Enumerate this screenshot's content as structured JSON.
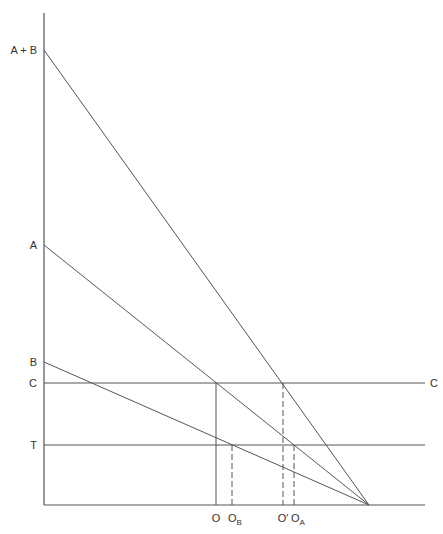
{
  "diagram": {
    "colors": {
      "line": "#555555",
      "text": "#333333",
      "background": "#ffffff"
    },
    "y_axis_labels": [
      {
        "id": "a_plus_b",
        "text": "A + B",
        "y": 50
      },
      {
        "id": "a",
        "text": "A",
        "y": 245
      },
      {
        "id": "b",
        "text": "B",
        "y": 362
      },
      {
        "id": "c",
        "text": "C",
        "y": 383
      },
      {
        "id": "t",
        "text": "T",
        "y": 445
      }
    ],
    "right_label": {
      "text": "C"
    },
    "x_axis_labels": [
      {
        "id": "o",
        "main": "O",
        "sub": "",
        "x": 216
      },
      {
        "id": "o_b",
        "main": "O",
        "sub": "B",
        "x": 232
      },
      {
        "id": "o_prime",
        "main": "O′",
        "sub": "",
        "x": 283
      },
      {
        "id": "o_a",
        "main": "O",
        "sub": "A",
        "x": 294
      }
    ],
    "lines": [
      {
        "name": "demand-a-plus-b",
        "from": "A + B",
        "to": "convergence point"
      },
      {
        "name": "demand-a",
        "from": "A",
        "to": "convergence point"
      },
      {
        "name": "demand-b",
        "from": "B",
        "to": "convergence point"
      },
      {
        "name": "cost-line-c",
        "label": "C"
      },
      {
        "name": "tax-line-t",
        "label": "T"
      }
    ]
  }
}
